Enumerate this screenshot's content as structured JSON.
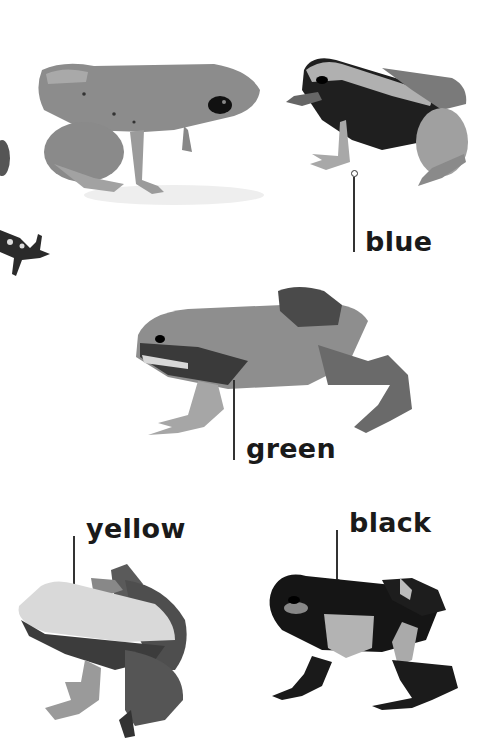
{
  "page": {
    "labels": {
      "blue": "blue",
      "green": "green",
      "yellow": "yellow",
      "black": "black"
    }
  },
  "frogs": [
    {
      "id": "unlabeled-top-left",
      "label": null,
      "tone": "mid-gray"
    },
    {
      "id": "blue",
      "label": "blue",
      "tone": "dark-with-light-stripe"
    },
    {
      "id": "green",
      "label": "green",
      "tone": "mid-gray-with-dark-side"
    },
    {
      "id": "yellow",
      "label": "yellow",
      "tone": "light-back-dark-legs"
    },
    {
      "id": "black",
      "label": "black",
      "tone": "black-with-light-patches"
    }
  ],
  "colors": {
    "ink": "#1a1a1a",
    "callout_line": "#333333",
    "background": "#ffffff"
  }
}
